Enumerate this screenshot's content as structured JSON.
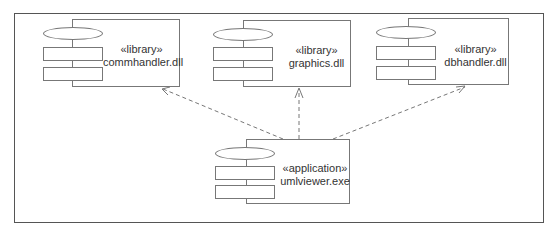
{
  "diagram": {
    "type": "UML component diagram",
    "components": [
      {
        "id": "commhandler",
        "stereotype": "«library»",
        "name": "commhandler.dll"
      },
      {
        "id": "graphics",
        "stereotype": "«library»",
        "name": "graphics.dll"
      },
      {
        "id": "dbhandler",
        "stereotype": "«library»",
        "name": "dbhandler.dll"
      },
      {
        "id": "umlviewer",
        "stereotype": "«application»",
        "name": "umlviewer.exe"
      }
    ],
    "dependencies": [
      {
        "from": "umlviewer.exe",
        "to": "commhandler.dll",
        "style": "dashed-arrow"
      },
      {
        "from": "umlviewer.exe",
        "to": "graphics.dll",
        "style": "dashed-arrow"
      },
      {
        "from": "umlviewer.exe",
        "to": "dbhandler.dll",
        "style": "dashed-arrow"
      }
    ]
  }
}
